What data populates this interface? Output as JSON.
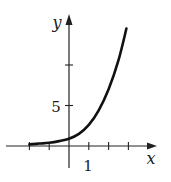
{
  "chart_data": {
    "type": "line",
    "title": "",
    "xlabel": "x",
    "ylabel": "y",
    "x_tick_labels": [
      "1"
    ],
    "y_tick_labels": [
      "5"
    ],
    "x_ticks": [
      -2,
      -1,
      0,
      1,
      2,
      3
    ],
    "y_ticks": [
      5,
      10
    ],
    "xlim": [
      -2.4,
      4.4
    ],
    "ylim": [
      -2,
      16
    ],
    "grid": false,
    "legend": null,
    "series": [
      {
        "name": "curve",
        "x": [
          -2.0,
          -1.5,
          -1.0,
          -0.5,
          0.0,
          0.5,
          1.0,
          1.5,
          2.0,
          2.5,
          2.9
        ],
        "y": [
          0.2,
          0.3,
          0.4,
          0.6,
          0.9,
          1.5,
          2.6,
          4.4,
          7.0,
          10.6,
          14.5
        ]
      }
    ]
  }
}
